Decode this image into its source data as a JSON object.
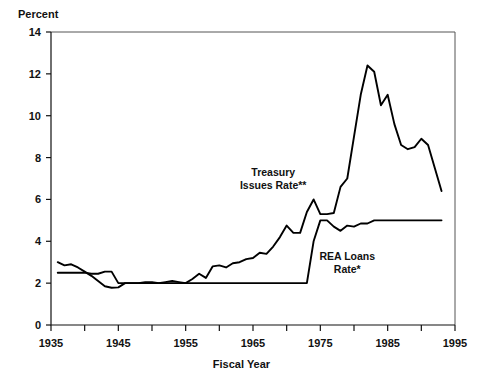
{
  "chart_data": {
    "type": "line",
    "title": "",
    "xlabel": "Fiscal Year",
    "ylabel": "Percent",
    "xlim": [
      1935,
      1995
    ],
    "ylim": [
      0,
      14
    ],
    "xticks": [
      1935,
      1945,
      1955,
      1965,
      1975,
      1985,
      1995
    ],
    "xticks_minor": [
      1940,
      1950,
      1960,
      1970,
      1980,
      1990
    ],
    "yticks": [
      0,
      2,
      4,
      6,
      8,
      10,
      12,
      14
    ],
    "grid": false,
    "legend": "inline-annotations",
    "series": [
      {
        "name": "Treasury Issues Rate**",
        "label_x": 1968,
        "label_y": 7.1,
        "x": [
          1936,
          1937,
          1938,
          1939,
          1940,
          1941,
          1942,
          1943,
          1944,
          1945,
          1946,
          1947,
          1948,
          1949,
          1950,
          1951,
          1952,
          1953,
          1954,
          1955,
          1956,
          1957,
          1958,
          1959,
          1960,
          1961,
          1962,
          1963,
          1964,
          1965,
          1966,
          1967,
          1968,
          1969,
          1970,
          1971,
          1972,
          1973,
          1974,
          1975,
          1976,
          1977,
          1978,
          1979,
          1980,
          1981,
          1982,
          1983,
          1984,
          1985,
          1986,
          1987,
          1988,
          1989,
          1990,
          1991,
          1992,
          1993
        ],
        "y": [
          3.0,
          2.85,
          2.9,
          2.75,
          2.55,
          2.35,
          2.1,
          1.85,
          1.78,
          1.8,
          2.0,
          2.0,
          2.0,
          2.05,
          2.05,
          2.0,
          2.05,
          2.1,
          2.05,
          2.0,
          2.2,
          2.45,
          2.25,
          2.8,
          2.85,
          2.75,
          2.95,
          3.0,
          3.15,
          3.2,
          3.45,
          3.4,
          3.75,
          4.2,
          4.75,
          4.4,
          4.4,
          5.4,
          6.0,
          5.3,
          5.3,
          5.35,
          6.6,
          7.0,
          9.0,
          11.0,
          12.4,
          12.1,
          10.5,
          11.0,
          9.6,
          8.6,
          8.4,
          8.5,
          8.9,
          8.6,
          7.5,
          6.4
        ]
      },
      {
        "name": "REA Loans Rate*",
        "label_x": 1979,
        "label_y": 3.1,
        "x": [
          1936,
          1940,
          1941,
          1942,
          1943,
          1944,
          1945,
          1946,
          1950,
          1955,
          1960,
          1965,
          1970,
          1971,
          1972,
          1973,
          1974,
          1975,
          1976,
          1977,
          1978,
          1979,
          1980,
          1981,
          1982,
          1983,
          1984,
          1985,
          1986,
          1987,
          1988,
          1989,
          1990,
          1991,
          1992,
          1993
        ],
        "y": [
          2.5,
          2.5,
          2.45,
          2.45,
          2.55,
          2.55,
          2.0,
          2.0,
          2.0,
          2.0,
          2.0,
          2.0,
          2.0,
          2.0,
          2.0,
          2.0,
          4.0,
          5.0,
          5.0,
          4.7,
          4.5,
          4.75,
          4.7,
          4.85,
          4.85,
          5.0,
          5.0,
          5.0,
          5.0,
          5.0,
          5.0,
          5.0,
          5.0,
          5.0,
          5.0,
          5.0
        ]
      }
    ]
  },
  "axes": {
    "y_title": "Percent",
    "x_title": "Fiscal Year"
  }
}
